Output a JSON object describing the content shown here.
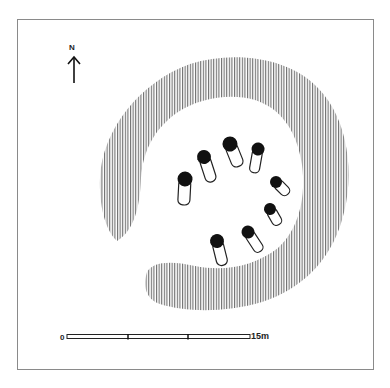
{
  "diagram": {
    "type": "archaeological site plan (stone circle with surrounding bank)",
    "north_arrow": {
      "label": "N",
      "icon": "north-arrow-icon"
    },
    "scale_bar": {
      "start_label": "0",
      "end_label": "15m",
      "divisions": 3
    },
    "bank": {
      "fill": "vertical-hatching",
      "hatch_color": "#6e6e6e",
      "shape": "C-shaped ring open to south-west"
    },
    "stones": [
      {
        "id": 1,
        "head": [
          185,
          179
        ],
        "tail": [
          183,
          204
        ]
      },
      {
        "id": 2,
        "head": [
          204,
          157
        ],
        "tail": [
          213,
          182
        ]
      },
      {
        "id": 3,
        "head": [
          230,
          144
        ],
        "tail": [
          240,
          166
        ]
      },
      {
        "id": 4,
        "head": [
          258,
          149
        ],
        "tail": [
          255,
          172
        ]
      },
      {
        "id": 5,
        "head": [
          276,
          182
        ],
        "tail": [
          289,
          194
        ]
      },
      {
        "id": 6,
        "head": [
          270,
          209
        ],
        "tail": [
          279,
          224
        ]
      },
      {
        "id": 7,
        "head": [
          248,
          232
        ],
        "tail": [
          261,
          251
        ]
      },
      {
        "id": 8,
        "head": [
          217,
          241
        ],
        "tail": [
          224,
          264
        ]
      }
    ],
    "colors": {
      "stone_head": "#111111",
      "stone_outline": "#222222",
      "frame": "#8a8a8a"
    }
  }
}
